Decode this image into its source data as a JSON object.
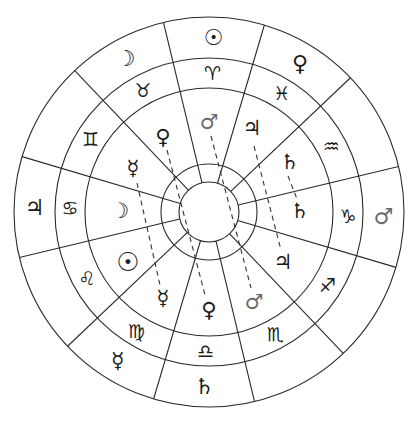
{
  "diagram": {
    "type": "astrological-wheel",
    "center": [
      209,
      212
    ],
    "radii": {
      "hub": 30,
      "hub_ring": 48,
      "inner_planets": 124,
      "signs": 154,
      "outer": 195
    },
    "spoke_angles_deg": [
      15,
      45,
      75,
      105,
      135,
      165,
      195,
      225,
      255,
      285,
      315,
      345
    ],
    "sectors": [
      {
        "angle": 90,
        "sign": "♈",
        "sign_name": "Aries",
        "outer_planet": "☉",
        "outer_planet_name": "Sun"
      },
      {
        "angle": 60,
        "sign": "♓",
        "sign_name": "Pisces",
        "outer_planet": "♀",
        "outer_planet_name": "Venus"
      },
      {
        "angle": 30,
        "sign": "♒",
        "sign_name": "Aquarius",
        "outer_planet": "",
        "outer_planet_name": ""
      },
      {
        "angle": 0,
        "sign": "♑",
        "sign_name": "Capricorn",
        "outer_planet": "♂",
        "outer_planet_name": "Mars"
      },
      {
        "angle": -30,
        "sign": "♐",
        "sign_name": "Sagittarius",
        "outer_planet": "",
        "outer_planet_name": ""
      },
      {
        "angle": -60,
        "sign": "♏",
        "sign_name": "Scorpio",
        "outer_planet": "",
        "outer_planet_name": ""
      },
      {
        "angle": -90,
        "sign": "♎",
        "sign_name": "Libra",
        "outer_planet": "♄",
        "outer_planet_name": "Saturn"
      },
      {
        "angle": -120,
        "sign": "♍",
        "sign_name": "Virgo",
        "outer_planet": "☿",
        "outer_planet_name": "Mercury"
      },
      {
        "angle": -150,
        "sign": "♌",
        "sign_name": "Leo",
        "outer_planet": "",
        "outer_planet_name": ""
      },
      {
        "angle": 180,
        "sign": "♋",
        "sign_name": "Cancer",
        "outer_planet": "♃",
        "outer_planet_name": "Jupiter"
      },
      {
        "angle": 150,
        "sign": "♊",
        "sign_name": "Gemini",
        "outer_planet": "",
        "outer_planet_name": ""
      },
      {
        "angle": 120,
        "sign": "♉",
        "sign_name": "Taurus",
        "outer_planet": "☽",
        "outer_planet_name": "Moon"
      }
    ],
    "inner_planets": [
      {
        "glyph": "♀",
        "name": "Venus",
        "x": 163,
        "y": 137
      },
      {
        "glyph": "♂",
        "name": "Mars",
        "x": 209,
        "y": 122,
        "light": true
      },
      {
        "glyph": "♃",
        "name": "Jupiter",
        "x": 252,
        "y": 128
      },
      {
        "glyph": "♄",
        "name": "Saturn",
        "x": 290,
        "y": 162
      },
      {
        "glyph": "♄",
        "name": "Saturn",
        "x": 300,
        "y": 211
      },
      {
        "glyph": "♃",
        "name": "Jupiter",
        "x": 283,
        "y": 262
      },
      {
        "glyph": "♂",
        "name": "Mars",
        "x": 254,
        "y": 302,
        "light": true
      },
      {
        "glyph": "♀",
        "name": "Venus",
        "x": 209,
        "y": 310
      },
      {
        "glyph": "☿",
        "name": "Mercury",
        "x": 163,
        "y": 298
      },
      {
        "glyph": "☉",
        "name": "Sun",
        "x": 128,
        "y": 262
      },
      {
        "glyph": "☽",
        "name": "Moon",
        "x": 120,
        "y": 211
      },
      {
        "glyph": "☿",
        "name": "Mercury",
        "x": 133,
        "y": 168
      }
    ],
    "dashed_links": [
      {
        "from": "Venus",
        "x1": 167,
        "y1": 150,
        "x2": 205,
        "y2": 295
      },
      {
        "from": "Mercury",
        "x1": 137,
        "y1": 183,
        "x2": 160,
        "y2": 285
      },
      {
        "from": "Mars",
        "x1": 211,
        "y1": 136,
        "x2": 251,
        "y2": 288
      },
      {
        "from": "Jupiter",
        "x1": 254,
        "y1": 146,
        "x2": 281,
        "y2": 250
      },
      {
        "from": "Saturn",
        "x1": 288,
        "y1": 176,
        "x2": 297,
        "y2": 199
      }
    ],
    "colors": {
      "line": "#2b2b2b",
      "glyph": "#1a1a1a",
      "glyph_light": "#6a6a6a",
      "background": "#ffffff"
    }
  }
}
